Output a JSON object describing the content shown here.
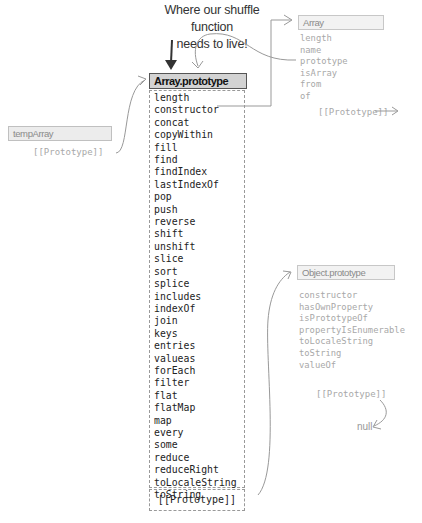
{
  "annotation": {
    "line1": "Where our shuffle function",
    "line2": "needs to live!"
  },
  "temp_array": {
    "title": "tempArray",
    "prototype_label": "[[Prototype]]"
  },
  "array_prototype": {
    "title": "Array.prototype",
    "members": [
      "length",
      "constructor",
      "concat",
      "copyWithin",
      "fill",
      "find",
      "findIndex",
      "lastIndexOf",
      "pop",
      "push",
      "reverse",
      "shift",
      "unshift",
      "slice",
      "sort",
      "splice",
      "includes",
      "indexOf",
      "join",
      "keys",
      "entries",
      "valueas",
      "forEach",
      "filter",
      "flat",
      "flatMap",
      "map",
      "every",
      "some",
      "reduce",
      "reduceRight",
      "toLocaleString",
      "toString"
    ],
    "prototype_label": "[[Prototype]]"
  },
  "array_ctor": {
    "title": "Array",
    "members": [
      "length",
      "name",
      "prototype",
      "isArray",
      "from",
      "of"
    ],
    "prototype_label": "[[Prototype]]"
  },
  "object_prototype": {
    "title": "Object.prototype",
    "members": [
      "constructor",
      "hasOwnProperty",
      "isPrototypeOf",
      "propertyIsEnumerable",
      "toLocaleString",
      "toString",
      "valueOf"
    ],
    "prototype_label": "[[Prototype]]",
    "null_label": "null"
  },
  "colors": {
    "main_header_bg": "#d3d3d3",
    "faded_text": "#a8a8a8",
    "arrow": "#999999",
    "annotation_arrow": "#333333"
  }
}
